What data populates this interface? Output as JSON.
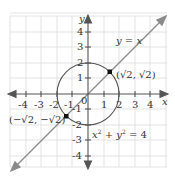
{
  "diagram": {
    "title": "",
    "axes": {
      "x_label": "x",
      "y_label": "y",
      "x_ticks": [
        "-4",
        "-3",
        "-2",
        "-1",
        "1",
        "2",
        "3",
        "4"
      ],
      "y_ticks": [
        "4",
        "3",
        "2",
        "1",
        "-1",
        "-2",
        "-3",
        "-4"
      ],
      "origin_label": "0",
      "range": [
        -4.5,
        4.5
      ]
    },
    "curves": [
      {
        "name": "line",
        "label": "y = x",
        "color": "#8a8a8a"
      },
      {
        "name": "circle",
        "label": "x² + y² = 4",
        "radius": 2,
        "color": "#555555"
      }
    ],
    "points": [
      {
        "label": "(√2, √2)",
        "x": 1.414,
        "y": 1.414
      },
      {
        "label": "(−√2, −√2)",
        "x": -1.414,
        "y": -1.414
      }
    ],
    "labels": {
      "line_eq": "y = x",
      "circle_eq_x": "x",
      "circle_eq_plus": " + ",
      "circle_eq_y": "y",
      "circle_eq_rhs": " = 4",
      "sup2": "2",
      "pt1": "(√2, √2)",
      "pt2": "(−√2, −√2)"
    },
    "colors": {
      "grid": "#d9d9d9",
      "axis": "#555555",
      "line": "#8a8a8a",
      "circle": "#555555",
      "point": "#111111"
    }
  }
}
